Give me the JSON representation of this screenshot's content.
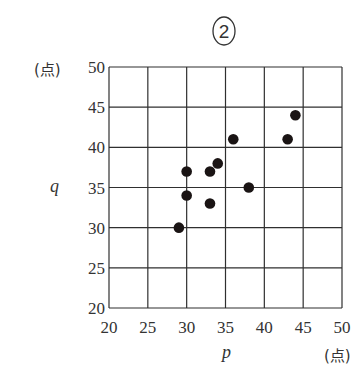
{
  "header": {
    "badge": "2"
  },
  "chart_data": {
    "type": "scatter",
    "title": "②",
    "xlabel": "p",
    "ylabel": "q",
    "x_unit": "(点)",
    "y_unit": "(点)",
    "xlim": [
      20,
      50
    ],
    "ylim": [
      20,
      50
    ],
    "x_ticks": [
      20,
      25,
      30,
      35,
      40,
      45,
      50
    ],
    "y_ticks": [
      20,
      25,
      30,
      35,
      40,
      45,
      50
    ],
    "grid": true,
    "legend": "none",
    "points": [
      {
        "x": 29,
        "y": 30
      },
      {
        "x": 30,
        "y": 34
      },
      {
        "x": 30,
        "y": 37
      },
      {
        "x": 33,
        "y": 33
      },
      {
        "x": 33,
        "y": 37
      },
      {
        "x": 34,
        "y": 38
      },
      {
        "x": 36,
        "y": 41
      },
      {
        "x": 38,
        "y": 35
      },
      {
        "x": 43,
        "y": 41
      },
      {
        "x": 44,
        "y": 44
      }
    ]
  },
  "style": {
    "line_color": "#2f2f2f",
    "point_color": "#1a1414"
  }
}
